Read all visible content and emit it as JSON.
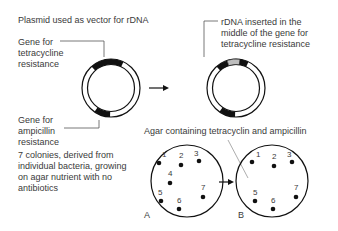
{
  "title": "Plasmid used as vector for rDNA",
  "labels": {
    "tet_gene": "Gene for\ntetracycline\nresistance",
    "amp_gene": "Gene for\nampicillin\nresistance",
    "rdna_inserted": "rDNA inserted in the\nmiddle of the gene for\ntetracycline resistance",
    "agar": "Agar containing tetracyclin and ampicillin",
    "colonies": "7 colonies, derived from\nindividual bacteria, growing\non agar nutrient with no\nantibiotics",
    "dish_a": "A",
    "dish_b": "B"
  },
  "dish_a_colonies": [
    "1",
    "2",
    "3",
    "4",
    "5",
    "6",
    "7"
  ],
  "dish_b_colonies": [
    "1",
    "2",
    "3",
    "5",
    "6",
    "7"
  ],
  "colors": {
    "ink": "#111111",
    "text": "#3a3a3a",
    "insert": "#bdbdbd",
    "leader": "#555555"
  }
}
